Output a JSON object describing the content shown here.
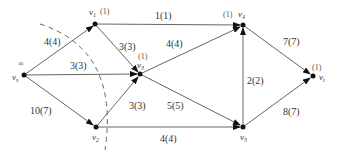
{
  "diagram": {
    "type": "flow-network",
    "nodes": [
      {
        "id": "vs",
        "label": "v",
        "sub": "s",
        "mark": "∞",
        "x": 24,
        "y": 75
      },
      {
        "id": "v1",
        "label": "v",
        "sub": "1",
        "mark": "(1)",
        "x": 95,
        "y": 24
      },
      {
        "id": "v2",
        "label": "v",
        "sub": "2",
        "mark": "",
        "x": 96,
        "y": 127
      },
      {
        "id": "v3",
        "label": "v",
        "sub": "3",
        "mark": "(1)",
        "x": 140,
        "y": 74
      },
      {
        "id": "v4",
        "label": "v",
        "sub": "4",
        "mark": "(1)",
        "x": 243,
        "y": 25
      },
      {
        "id": "v5",
        "label": "v",
        "sub": "5",
        "mark": "",
        "x": 243,
        "y": 127
      },
      {
        "id": "vt",
        "label": "v",
        "sub": "t",
        "mark": "(1)",
        "x": 313,
        "y": 76
      }
    ],
    "edges": [
      {
        "from": "vs",
        "to": "v1",
        "label": "4(4)"
      },
      {
        "from": "vs",
        "to": "v3",
        "label": "3(3)"
      },
      {
        "from": "vs",
        "to": "v2",
        "label": "10(7)"
      },
      {
        "from": "v1",
        "to": "v4",
        "label": "1(1)"
      },
      {
        "from": "v1",
        "to": "v3",
        "label": "3(3)"
      },
      {
        "from": "v2",
        "to": "v3",
        "label": "3(3)"
      },
      {
        "from": "v2",
        "to": "v5",
        "label": "4(4)"
      },
      {
        "from": "v3",
        "to": "v4",
        "label": "4(4)"
      },
      {
        "from": "v3",
        "to": "v5",
        "label": "5(5)"
      },
      {
        "from": "v5",
        "to": "v4",
        "label": "2(2)"
      },
      {
        "from": "v4",
        "to": "vt",
        "label": "7(7)"
      },
      {
        "from": "v5",
        "to": "vt",
        "label": "8(7)"
      }
    ],
    "cut_line": "dashed-arc"
  }
}
